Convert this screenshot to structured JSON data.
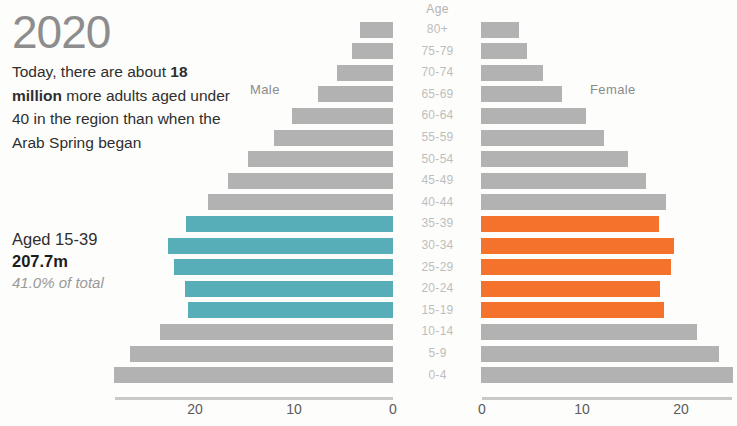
{
  "narrative": {
    "year": "2020",
    "lede_prefix": "Today, there are about ",
    "lede_bold": "18 million",
    "lede_suffix": " more adults aged under 40 in the region than when the Arab Spring began",
    "stat_label": "Aged 15-39",
    "stat_value": "207.7m",
    "stat_share": "41.0% of total"
  },
  "labels": {
    "male": "Male",
    "female": "Female",
    "age_header": "Age"
  },
  "colors": {
    "gray": "#b2b2b2",
    "teal": "#58aeb8",
    "orange": "#f4722b",
    "year_text": "#8d8d8d",
    "axis_text": "#5b5b5b"
  },
  "chart_data": {
    "type": "bar",
    "subtype": "population-pyramid",
    "title": "2020",
    "xlabel": "",
    "ylabel": "Age",
    "xlim": [
      0,
      25
    ],
    "grid": false,
    "legend_position": "inline-labels",
    "highlight_band": "15-39",
    "highlight_colors": {
      "male": "#58aeb8",
      "female": "#f4722b"
    },
    "categories": [
      "80+",
      "75-79",
      "70-74",
      "65-69",
      "60-64",
      "55-59",
      "50-54",
      "45-49",
      "40-44",
      "35-39",
      "30-34",
      "25-29",
      "20-24",
      "15-19",
      "10-14",
      "5-9",
      "0-4"
    ],
    "male_ticks": [
      "20",
      "10",
      "0"
    ],
    "female_ticks": [
      "0",
      "10",
      "20"
    ],
    "series": [
      {
        "name": "Male",
        "side": "left",
        "values": [
          3.3,
          4.1,
          5.6,
          7.6,
          10.2,
          12.0,
          14.6,
          16.6,
          18.6,
          20.8,
          22.7,
          22.1,
          20.9,
          20.6,
          23.5,
          26.5,
          28.1
        ]
      },
      {
        "name": "Female",
        "side": "right",
        "values": [
          3.8,
          4.6,
          6.2,
          8.2,
          10.6,
          12.4,
          14.8,
          16.6,
          18.6,
          17.9,
          19.4,
          19.1,
          18.0,
          18.4,
          21.8,
          24.0,
          25.4
        ]
      }
    ],
    "highlighted_categories": [
      "35-39",
      "30-34",
      "25-29",
      "20-24",
      "15-19"
    ]
  }
}
